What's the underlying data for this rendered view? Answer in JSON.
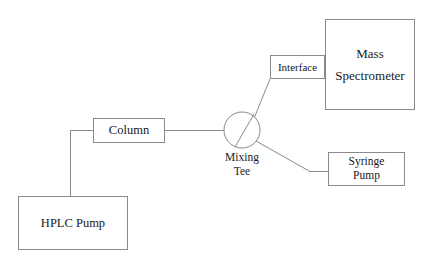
{
  "diagram": {
    "background_color": "#ffffff",
    "line_color": "#8a8a8a",
    "text_color": "#1a1a1a",
    "nodes": {
      "mass_spectrometer": {
        "line1": "Mass",
        "line2": "Spectrometer"
      },
      "interface": {
        "label": "Interface"
      },
      "syringe_pump": {
        "line1": "Syringe",
        "line2": "Pump"
      },
      "column": {
        "label": "Column"
      },
      "hplc_pump": {
        "label": "HPLC Pump"
      },
      "mixing_tee": {
        "line1": "Mixing",
        "line2": "Tee"
      }
    },
    "connections": [
      "hplc-pump-to-column",
      "column-to-mixing-tee",
      "mixing-tee-to-interface",
      "mixing-tee-to-syringe-pump",
      "interface-to-mass-spectrometer"
    ]
  }
}
